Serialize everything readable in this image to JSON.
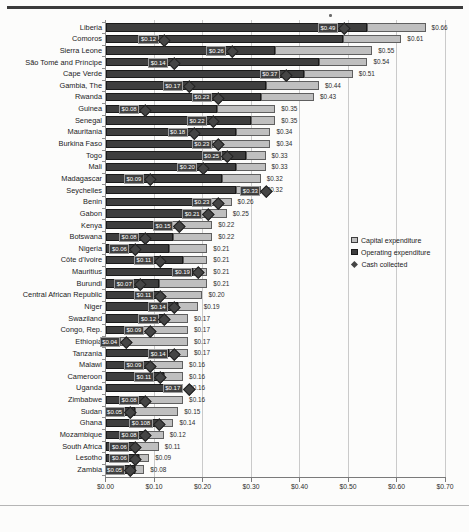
{
  "chart_data": {
    "type": "bar",
    "orientation": "horizontal",
    "stacked": true,
    "title": "",
    "xlabel": "",
    "ylabel": "",
    "grid": true,
    "x_axis": {
      "min": 0,
      "max": 0.7,
      "tick_step": 0.1,
      "tick_labels": [
        "$0.00",
        "$0.10",
        "$0.20",
        "$0.30",
        "$0.40",
        "$0.50",
        "$0.60",
        "$0.70"
      ]
    },
    "categories": [
      "Liberia",
      "Comoros",
      "Sierra Leone",
      "São Tomé and Príncipe",
      "Cape Verde",
      "Gambia, The",
      "Rwanda",
      "Guinea",
      "Senegal",
      "Mauritania",
      "Burkina Faso",
      "Togo",
      "Mali",
      "Madagascar",
      "Seychelles",
      "Benin",
      "Gabon",
      "Kenya",
      "Botswana",
      "Nigeria",
      "Côte d'Ivoire",
      "Mauritius",
      "Burundi",
      "Central African Republic",
      "Niger",
      "Swaziland",
      "Congo, Rep.",
      "Ethiopia",
      "Tanzania",
      "Malawi",
      "Cameroon",
      "Uganda",
      "Zimbabwe",
      "Sudan",
      "Ghana",
      "Mozambique",
      "South Africa",
      "Lesotho",
      "Zambia"
    ],
    "series": [
      {
        "name": "Operating expenditure",
        "color": "#3e3e3e",
        "values": [
          0.54,
          0.49,
          0.35,
          0.44,
          0.41,
          0.33,
          0.32,
          0.23,
          0.3,
          0.27,
          0.22,
          0.29,
          0.27,
          0.24,
          0.27,
          0.19,
          0.18,
          0.13,
          0.14,
          0.13,
          0.16,
          0.18,
          0.11,
          0.11,
          0.15,
          0.12,
          0.07,
          0.03,
          0.13,
          0.09,
          0.12,
          0.14,
          0.08,
          0.06,
          0.11,
          0.08,
          0.06,
          0.07,
          0.06
        ]
      },
      {
        "name": "Capital expenditure",
        "color": "#bfbfbf",
        "values": [
          0.12,
          0.12,
          0.2,
          0.1,
          0.1,
          0.11,
          0.11,
          0.12,
          0.05,
          0.07,
          0.12,
          0.04,
          0.06,
          0.08,
          0.05,
          0.07,
          0.07,
          0.09,
          0.08,
          0.08,
          0.05,
          0.03,
          0.1,
          0.09,
          0.04,
          0.05,
          0.1,
          0.14,
          0.04,
          0.07,
          0.04,
          0.02,
          0.08,
          0.09,
          0.03,
          0.04,
          0.05,
          0.02,
          0.02
        ]
      },
      {
        "name": "Cash collected",
        "color": "#454545",
        "marker": "diamond",
        "values": [
          0.49,
          0.12,
          0.26,
          0.14,
          0.37,
          0.17,
          0.23,
          0.08,
          0.22,
          0.18,
          0.23,
          0.25,
          0.2,
          0.09,
          0.33,
          0.23,
          0.21,
          0.15,
          0.08,
          0.06,
          0.11,
          0.19,
          0.07,
          0.11,
          0.14,
          0.12,
          0.09,
          0.04,
          0.14,
          0.09,
          0.11,
          0.17,
          0.08,
          0.05,
          0.108,
          0.08,
          0.06,
          0.06,
          0.05
        ],
        "labels": [
          "$0.49",
          "$0.12",
          "$0.26",
          "$0.14",
          "$0.37",
          "$0.17",
          "$0.23",
          "$0.08",
          "$0.22",
          "$0.18",
          "$0.23",
          "$0.25",
          "$0.20",
          "$0.09",
          "$0.33",
          "$0.23",
          "$0.21",
          "$0.15",
          "$0.08",
          "$0.06",
          "$0.11",
          "$0.19",
          "$0.07",
          "$0.11",
          "$0.14",
          "$0.12",
          "$0.09",
          "$0.04",
          "$0.14",
          "$0.09",
          "$0.11",
          "$0.17",
          "$0.08",
          "$0.05",
          "$0.108",
          "$0.08",
          "$0.06",
          "$0.06",
          "$0.05"
        ]
      }
    ],
    "total_labels": [
      "$0.66",
      "$0.61",
      "$0.55",
      "$0.54",
      "$0.51",
      "$0.44",
      "$0.43",
      "$0.35",
      "$0.35",
      "$0.34",
      "$0.34",
      "$0.33",
      "$0.33",
      "$0.32",
      "$0.32",
      "$0.26",
      "$0.25",
      "$0.22",
      "$0.22",
      "$0.21",
      "$0.21",
      "$0.21",
      "$0.21",
      "$0.20",
      "$0.19",
      "$0.17",
      "$0.17",
      "$0.17",
      "$0.17",
      "$0.16",
      "$0.16",
      "$0.16",
      "$0.16",
      "$0.15",
      "$0.14",
      "$0.12",
      "$0.11",
      "$0.09",
      "$0.08"
    ],
    "legend": {
      "position": "right",
      "items": [
        {
          "label": "Capital expenditure"
        },
        {
          "label": "Operating expenditure"
        },
        {
          "label": "Cash collected"
        }
      ]
    }
  }
}
